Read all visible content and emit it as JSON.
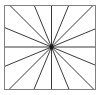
{
  "figure": {
    "name": "sunburst-radial-lines",
    "canvas": {
      "width": 104,
      "height": 95,
      "background": "#ffffff"
    },
    "frame": {
      "name": "rectangle-border",
      "x": 4.5,
      "y": 5.5,
      "width": 91,
      "height": 84,
      "stroke": "#808080",
      "stroke_width": 1,
      "fill": "none"
    },
    "center": {
      "x": 51.5,
      "y": 47.0
    },
    "rays": {
      "count": 16,
      "angle_step_degrees": 22.5,
      "start_angle_degrees": 0,
      "stroke": "#3a3a3a",
      "stroke_width": 1,
      "angles_degrees": [
        0,
        22.5,
        45,
        67.5,
        90,
        112.5,
        135,
        157.5,
        180,
        202.5,
        225,
        247.5,
        270,
        292.5,
        315,
        337.5
      ],
      "description": "Sixteen straight line segments radiating from the center point outward to the rectangle boundary, evenly spaced at 22.5 degree intervals."
    },
    "center_dot": {
      "name": "center-convergence-point",
      "radius": 2.2,
      "fill": "#1a1a1a"
    }
  }
}
